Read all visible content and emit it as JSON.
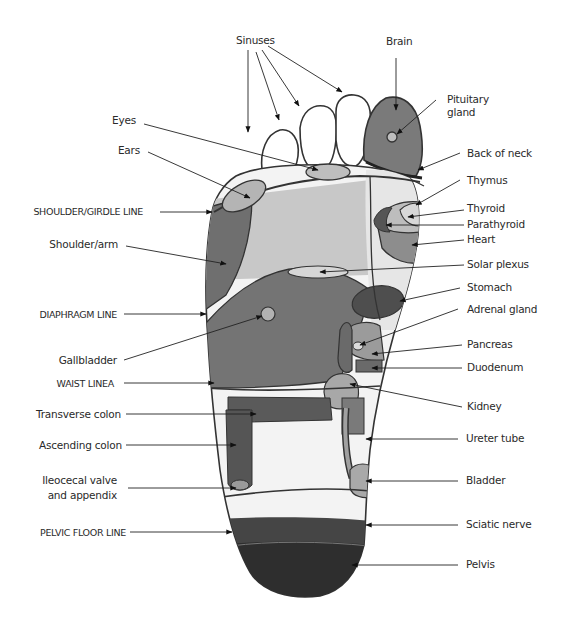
{
  "diagram": {
    "type": "foot-reflexology-map",
    "colors": {
      "background": "#ffffff",
      "outline": "#333333",
      "text": "#2a2a2a",
      "toe_fill": "#ffffff",
      "brain_zone": "#7a7a7a",
      "light_zone": "#c8c8c8",
      "mid_zone": "#9a9a9a",
      "dark_zone": "#6a6a6a",
      "liver_zone": "#727272",
      "stomach_zone": "#4e4e4e",
      "pelvis_zone": "#2e2e2e",
      "sciatic_zone": "#454545",
      "colon_zone": "#5a5a5a"
    },
    "labels_top": [
      {
        "id": "sinuses",
        "text": "Sinuses"
      },
      {
        "id": "brain",
        "text": "Brain"
      }
    ],
    "labels_left": [
      {
        "id": "eyes",
        "text": "Eyes"
      },
      {
        "id": "ears",
        "text": "Ears"
      },
      {
        "id": "shoulder_girdle_line",
        "text": "SHOULDER/GIRDLE LINE"
      },
      {
        "id": "shoulder_arm",
        "text": "Shoulder/arm"
      },
      {
        "id": "diaphragm_line",
        "text": "DIAPHRAGM LINE"
      },
      {
        "id": "gallbladder",
        "text": "Gallbladder"
      },
      {
        "id": "waist_line",
        "text": "WAIST LINEA"
      },
      {
        "id": "transverse_colon",
        "text": "Transverse colon"
      },
      {
        "id": "ascending_colon",
        "text": "Ascending colon"
      },
      {
        "id": "ileocecal_1",
        "text": "Ileocecal valve"
      },
      {
        "id": "ileocecal_2",
        "text": "and appendix"
      },
      {
        "id": "pelvic_floor_line",
        "text": "PELVIC FLOOR LINE"
      }
    ],
    "labels_right": [
      {
        "id": "pituitary_1",
        "text": "Pituitary"
      },
      {
        "id": "pituitary_2",
        "text": "gland"
      },
      {
        "id": "back_of_neck",
        "text": "Back of neck"
      },
      {
        "id": "thymus",
        "text": "Thymus"
      },
      {
        "id": "thyroid",
        "text": "Thyroid"
      },
      {
        "id": "parathyroid",
        "text": "Parathyroid"
      },
      {
        "id": "heart",
        "text": "Heart"
      },
      {
        "id": "solar_plexus",
        "text": "Solar plexus"
      },
      {
        "id": "stomach",
        "text": "Stomach"
      },
      {
        "id": "adrenal_gland",
        "text": "Adrenal gland"
      },
      {
        "id": "pancreas",
        "text": "Pancreas"
      },
      {
        "id": "duodenum",
        "text": "Duodenum"
      },
      {
        "id": "kidney",
        "text": "Kidney"
      },
      {
        "id": "ureter_tube",
        "text": "Ureter tube"
      },
      {
        "id": "bladder",
        "text": "Bladder"
      },
      {
        "id": "sciatic_nerve",
        "text": "Sciatic nerve"
      },
      {
        "id": "pelvis",
        "text": "Pelvis"
      }
    ]
  }
}
